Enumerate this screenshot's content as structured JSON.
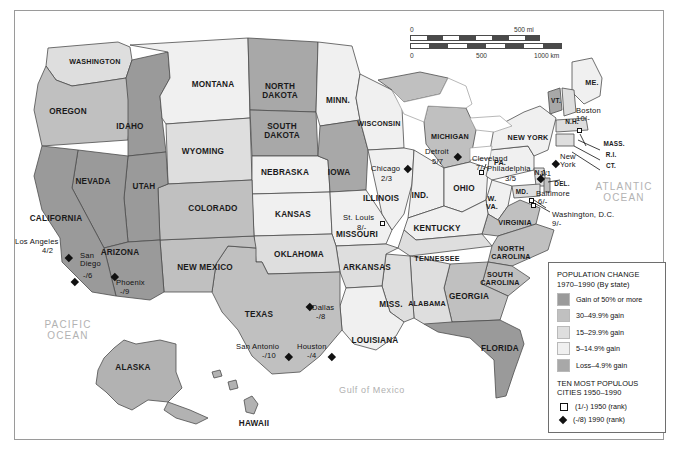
{
  "map": {
    "title": "United States Population Change 1970-1990",
    "scale_bar": {
      "miles_start": "0",
      "miles_end": "500 mi",
      "km_start": "0",
      "km_mid": "500",
      "km_end": "1000 km"
    },
    "ocean_labels": [
      {
        "name": "PACIFIC\nOCEAN",
        "x": 68,
        "y": 330
      },
      {
        "name": "ATLANTIC\nOCEAN",
        "x": 624,
        "y": 192
      },
      {
        "name": "Gulf of Mexico",
        "x": 372,
        "y": 391
      }
    ],
    "colors": {
      "gain50": "#9a9a9a",
      "gain30": "#c2c2c2",
      "gain15": "#e2e2e2",
      "gain5": "#f2f2f2",
      "loss": "#a8a8a8",
      "outline": "#4d4d4d",
      "text": "#1a1a1a",
      "ocean_text": "#b2b2b2"
    },
    "states": [
      {
        "label": "WASHINGTON",
        "x": 95,
        "y": 62,
        "cls": "sm"
      },
      {
        "label": "OREGON",
        "x": 68,
        "y": 112,
        "cls": ""
      },
      {
        "label": "IDAHO",
        "x": 130,
        "y": 127,
        "cls": ""
      },
      {
        "label": "MONTANA",
        "x": 213,
        "y": 85,
        "cls": ""
      },
      {
        "label": "NORTH\nDAKOTA",
        "x": 280,
        "y": 92,
        "cls": ""
      },
      {
        "label": "SOUTH\nDAKOTA",
        "x": 282,
        "y": 132,
        "cls": ""
      },
      {
        "label": "MINN.",
        "x": 338,
        "y": 101,
        "cls": ""
      },
      {
        "label": "WISCONSIN",
        "x": 379,
        "y": 124,
        "cls": "sm"
      },
      {
        "label": "MICHIGAN",
        "x": 450,
        "y": 137,
        "cls": "sm"
      },
      {
        "label": "WYOMING",
        "x": 203,
        "y": 152,
        "cls": ""
      },
      {
        "label": "NEBRASKA",
        "x": 285,
        "y": 173,
        "cls": ""
      },
      {
        "label": "IOWA",
        "x": 339,
        "y": 173,
        "cls": ""
      },
      {
        "label": "NEVADA",
        "x": 93,
        "y": 182,
        "cls": ""
      },
      {
        "label": "UTAH",
        "x": 144,
        "y": 187,
        "cls": ""
      },
      {
        "label": "COLORADO",
        "x": 213,
        "y": 209,
        "cls": ""
      },
      {
        "label": "KANSAS",
        "x": 293,
        "y": 215,
        "cls": ""
      },
      {
        "label": "ILLINOIS",
        "x": 381,
        "y": 199,
        "cls": ""
      },
      {
        "label": "IND.",
        "x": 420,
        "y": 196,
        "cls": ""
      },
      {
        "label": "OHIO",
        "x": 464,
        "y": 189,
        "cls": ""
      },
      {
        "label": "PA.",
        "x": 500,
        "y": 163,
        "cls": "sm"
      },
      {
        "label": "NEW YORK",
        "x": 528,
        "y": 138,
        "cls": "sm"
      },
      {
        "label": "CALIFORNIA",
        "x": 56,
        "y": 219,
        "cls": ""
      },
      {
        "label": "ARIZONA",
        "x": 120,
        "y": 253,
        "cls": ""
      },
      {
        "label": "NEW MEXICO",
        "x": 205,
        "y": 268,
        "cls": ""
      },
      {
        "label": "OKLAHOMA",
        "x": 299,
        "y": 255,
        "cls": ""
      },
      {
        "label": "MISSOURI",
        "x": 357,
        "y": 235,
        "cls": ""
      },
      {
        "label": "St. Louis",
        "x": 0,
        "y": 0,
        "cls": "skip"
      },
      {
        "label": "KENTUCKY",
        "x": 437,
        "y": 229,
        "cls": ""
      },
      {
        "label": "W.\nVA.",
        "x": 492,
        "y": 203,
        "cls": "sm"
      },
      {
        "label": "VIRGINIA",
        "x": 515,
        "y": 223,
        "cls": "sm"
      },
      {
        "label": "ARKANSAS",
        "x": 367,
        "y": 268,
        "cls": ""
      },
      {
        "label": "TENNESSEE",
        "x": 437,
        "y": 259,
        "cls": "sm"
      },
      {
        "label": "NORTH\nCAROLINA",
        "x": 511,
        "y": 253,
        "cls": "sm"
      },
      {
        "label": "SOUTH\nCAROLINA",
        "x": 500,
        "y": 279,
        "cls": "sm"
      },
      {
        "label": "TEXAS",
        "x": 259,
        "y": 315,
        "cls": ""
      },
      {
        "label": "MISS.",
        "x": 391,
        "y": 305,
        "cls": ""
      },
      {
        "label": "ALABAMA",
        "x": 427,
        "y": 304,
        "cls": "sm"
      },
      {
        "label": "GEORGIA",
        "x": 469,
        "y": 297,
        "cls": ""
      },
      {
        "label": "LOUISIANA",
        "x": 375,
        "y": 341,
        "cls": ""
      },
      {
        "label": "FLORIDA",
        "x": 500,
        "y": 349,
        "cls": ""
      },
      {
        "label": "ALASKA",
        "x": 133,
        "y": 368,
        "cls": ""
      },
      {
        "label": "HAWAII",
        "x": 254,
        "y": 424,
        "cls": ""
      },
      {
        "label": "ME.",
        "x": 592,
        "y": 83,
        "cls": "sm"
      },
      {
        "label": "VT.",
        "x": 556,
        "y": 101,
        "cls": "xs"
      },
      {
        "label": "N.H.",
        "x": 572,
        "y": 122,
        "cls": "xs"
      },
      {
        "label": "MASS.",
        "x": 614,
        "y": 144,
        "cls": "xs"
      },
      {
        "label": "R.I.",
        "x": 611,
        "y": 155,
        "cls": "xs"
      },
      {
        "label": "CT.",
        "x": 611,
        "y": 166,
        "cls": "xs"
      },
      {
        "label": "N.J.",
        "x": 541,
        "y": 173,
        "cls": "xs"
      },
      {
        "label": "DEL.",
        "x": 562,
        "y": 184,
        "cls": "xs"
      },
      {
        "label": "MD.",
        "x": 522,
        "y": 192,
        "cls": "xs"
      }
    ],
    "cities": [
      {
        "name": "Boston",
        "rank": "10/-",
        "tx": 576,
        "ty": 113,
        "mx": 577,
        "my": 128,
        "marker": "square"
      },
      {
        "name": "New\nYork",
        "rank": "1/1",
        "tx": 564,
        "ty": 157,
        "mx": 553,
        "my": 161,
        "marker": "diamond",
        "rank_inline": true
      },
      {
        "name": "Philadelphia",
        "rank": "3/5",
        "tx": 492,
        "ty": 169,
        "mx": 538,
        "my": 176,
        "marker": "diamond"
      },
      {
        "name": "Baltimore",
        "rank": "6/-",
        "tx": 538,
        "ty": 192,
        "mx": 529,
        "my": 198,
        "marker": "square"
      },
      {
        "name": "Washington, D.C.",
        "rank": "9/-",
        "tx": 552,
        "ty": 214,
        "mx": 531,
        "my": 203,
        "marker": "square"
      },
      {
        "name": "Cleveland",
        "rank": "7/-",
        "tx": 477,
        "ty": 157,
        "mx": 479,
        "my": 170,
        "marker": "square"
      },
      {
        "name": "Detroit",
        "rank": "5/7",
        "tx": 430,
        "ty": 152,
        "mx": 455,
        "my": 154,
        "marker": "diamond"
      },
      {
        "name": "Chicago",
        "rank": "2/3",
        "tx": 372,
        "ty": 169,
        "mx": 405,
        "my": 166,
        "marker": "diamond"
      },
      {
        "name": "St. Louis",
        "rank": "8/-",
        "tx": 345,
        "ty": 218,
        "mx": 380,
        "my": 221,
        "marker": "square"
      },
      {
        "name": "Los Angeles",
        "rank": "4/2",
        "tx": 16,
        "ty": 240,
        "mx": 66,
        "my": 255,
        "marker": "diamond"
      },
      {
        "name": "San\nDiego",
        "rank": "-/6",
        "tx": 79,
        "ty": 255,
        "mx": 72,
        "my": 279,
        "marker": "diamond"
      },
      {
        "name": "Phoenix",
        "rank": "-/9",
        "tx": 115,
        "ty": 281,
        "mx": 112,
        "my": 274,
        "marker": "diamond"
      },
      {
        "name": "Dallas",
        "rank": "-/8",
        "tx": 311,
        "ty": 305,
        "mx": 307,
        "my": 304,
        "marker": "diamond"
      },
      {
        "name": "San Antonio",
        "rank": "-/10",
        "tx": 237,
        "ty": 341,
        "mx": 286,
        "my": 354,
        "marker": "diamond"
      },
      {
        "name": "Houston",
        "rank": "-/4",
        "tx": 298,
        "ty": 340,
        "mx": 329,
        "my": 354,
        "marker": "diamond"
      }
    ]
  },
  "legend": {
    "title_line1": "POPULATION CHANGE",
    "title_line2": "1970–1990 (By state)",
    "items": [
      {
        "label": "Gain of 50% or more",
        "color": "#9a9a9a"
      },
      {
        "label": "30–49.9% gain",
        "color": "#c0c0c0"
      },
      {
        "label": "15–29.9% gain",
        "color": "#dedede"
      },
      {
        "label": "5–14.9% gain",
        "color": "#f0f0f0"
      },
      {
        "label": "Loss–4.9% gain",
        "color": "#a8a8a8"
      }
    ],
    "title2_line1": "TEN MOST POPULOUS",
    "title2_line2": "CITIES 1950–1990",
    "keys": [
      {
        "symbol": "square",
        "label": "(1/-) 1950 (rank)"
      },
      {
        "symbol": "diamond",
        "label": "(-/8) 1990 (rank)"
      }
    ]
  }
}
